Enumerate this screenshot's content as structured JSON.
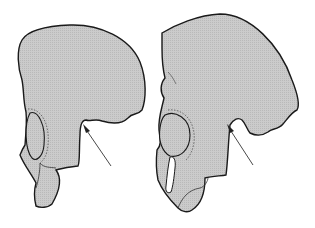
{
  "figure": {
    "panels": [
      {
        "id": "left",
        "label": "",
        "arrow_target": "sciatic-notch"
      },
      {
        "id": "right",
        "label": "",
        "arrow_target": "sciatic-notch"
      }
    ],
    "colors": {
      "bone_fill": "#c8c8c8",
      "outline": "#1a1a1a",
      "arrow": "#333333",
      "background": "#ffffff"
    }
  }
}
